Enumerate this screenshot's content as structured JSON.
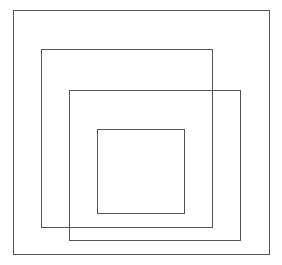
{
  "diagram": {
    "type": "nested-squares",
    "stroke_color": "#555555",
    "background": "#ffffff",
    "squares": [
      {
        "name": "outer-square",
        "left": 13,
        "top": 10,
        "width": 257,
        "height": 245
      },
      {
        "name": "second-square",
        "left": 41,
        "top": 49,
        "width": 200,
        "height": 179
      },
      {
        "name": "third-square",
        "left": 69,
        "top": 90,
        "width": 173,
        "height": 151
      },
      {
        "name": "inner-square",
        "left": 97,
        "top": 129,
        "width": 88,
        "height": 85
      }
    ]
  }
}
